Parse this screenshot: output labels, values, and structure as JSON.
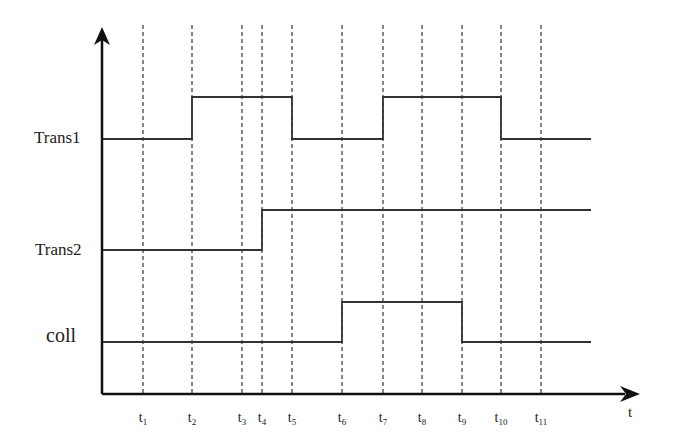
{
  "diagram": {
    "type": "timing-diagram",
    "axis": {
      "x_label": "t"
    },
    "signals": [
      {
        "name": "Trans1",
        "low_y": 139,
        "high_y": 97,
        "label_y": 128,
        "label_x": 34,
        "high_intervals": [
          [
            "t2",
            "t5"
          ],
          [
            "t7",
            "t10"
          ]
        ]
      },
      {
        "name": "Trans2",
        "low_y": 250,
        "high_y": 210,
        "label_y": 240,
        "label_x": 35,
        "high_intervals": [
          [
            "t4",
            "end"
          ]
        ]
      },
      {
        "name": "coll",
        "low_y": 342,
        "high_y": 302,
        "label_y": 324,
        "label_x": 46,
        "high_intervals": [
          [
            "t6",
            "t9"
          ]
        ]
      }
    ],
    "times": [
      {
        "base": "t",
        "sub": "1",
        "x": 143
      },
      {
        "base": "t",
        "sub": "2",
        "x": 192
      },
      {
        "base": "t",
        "sub": "3",
        "x": 242
      },
      {
        "base": "t",
        "sub": "4",
        "x": 262
      },
      {
        "base": "t",
        "sub": "5",
        "x": 292
      },
      {
        "base": "t",
        "sub": "6",
        "x": 342
      },
      {
        "base": "t",
        "sub": "7",
        "x": 383
      },
      {
        "base": "t",
        "sub": "8",
        "x": 422
      },
      {
        "base": "t",
        "sub": "9",
        "x": 462
      },
      {
        "base": "t",
        "sub": "10",
        "x": 501
      },
      {
        "base": "t",
        "sub": "11",
        "x": 541
      }
    ]
  }
}
